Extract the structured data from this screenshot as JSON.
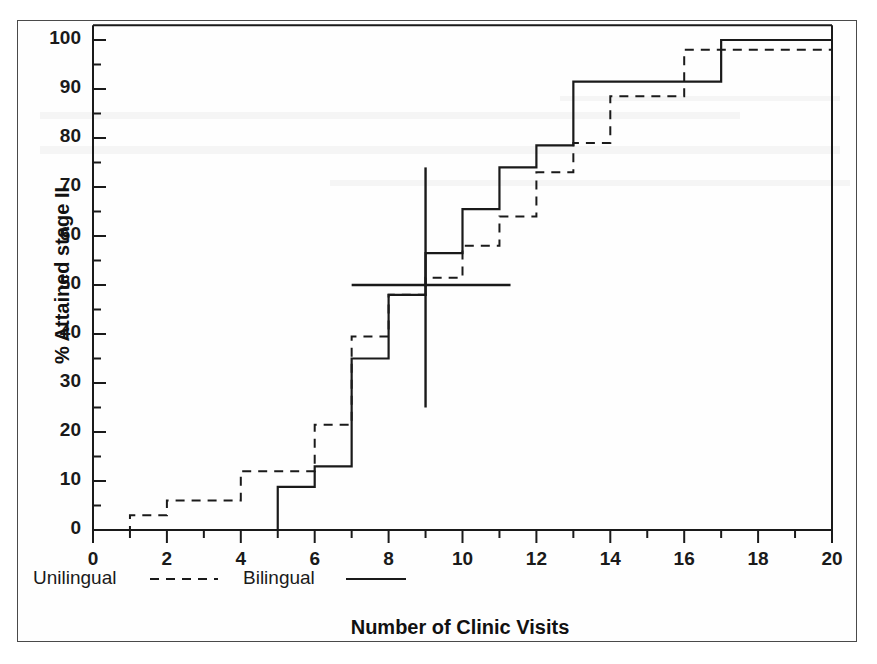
{
  "chart_data": {
    "type": "line",
    "title": "",
    "xlabel": "Number of Clinic Visits",
    "ylabel": "% Attained stage II",
    "xlim": [
      0,
      20
    ],
    "ylim": [
      0,
      103
    ],
    "xticks": [
      0,
      2,
      4,
      6,
      8,
      10,
      12,
      14,
      16,
      18,
      20
    ],
    "xtick_labels": [
      "0",
      "2",
      "4",
      "6",
      "8",
      "10",
      "12",
      "14",
      "16",
      "18",
      "20"
    ],
    "x_minor_ticks": [
      1,
      3,
      5,
      7,
      9,
      11,
      13,
      15,
      17,
      19
    ],
    "yticks": [
      0,
      10,
      20,
      30,
      40,
      50,
      60,
      70,
      80,
      90,
      100
    ],
    "ytick_labels": [
      "0",
      "10",
      "20",
      "30",
      "40",
      "50",
      "60",
      "70",
      "80",
      "90",
      "100"
    ],
    "y_minor_ticks": [
      5,
      15,
      25,
      35,
      45,
      55,
      65,
      75,
      85,
      95
    ],
    "grid": false,
    "step_style": "post",
    "legend_position": "below-axes-left",
    "series": [
      {
        "name": "Unilingual",
        "style": "dashed",
        "color": "#1a1a1a",
        "x": [
          0,
          1,
          2,
          4,
          6,
          7,
          8,
          9,
          10,
          11,
          12,
          13,
          14,
          16,
          20
        ],
        "y": [
          0,
          3,
          6,
          12,
          21.5,
          39.5,
          48,
          51.5,
          58,
          64,
          73,
          79,
          88.5,
          98,
          98
        ]
      },
      {
        "name": "Bilingual",
        "style": "solid",
        "color": "#1a1a1a",
        "x": [
          0,
          5,
          6,
          7,
          8,
          9,
          10,
          11,
          12,
          13,
          15,
          17,
          20
        ],
        "y": [
          0,
          8.8,
          13,
          35,
          48,
          56.5,
          65.5,
          74,
          78.5,
          91.5,
          91.5,
          100,
          100
        ]
      }
    ],
    "annotations": [
      {
        "name": "median-vertical-line",
        "type": "vline",
        "x": 9,
        "y_from": 25,
        "y_to": 74
      },
      {
        "name": "median-horizontal-line",
        "type": "hline",
        "y": 50,
        "x_from": 7,
        "x_to": 11.3
      }
    ]
  },
  "legend": {
    "entries": [
      {
        "label": "Unilingual",
        "style": "dashed"
      },
      {
        "label": "Bilingual",
        "style": "solid"
      }
    ]
  }
}
